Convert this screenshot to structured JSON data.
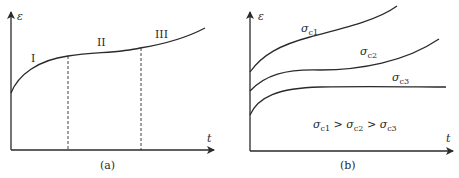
{
  "panel_a": {
    "caption": "(a)",
    "y_axis_label": "ε",
    "x_axis_label": "t",
    "stages": [
      {
        "label": "I"
      },
      {
        "label": "II"
      },
      {
        "label": "III"
      }
    ]
  },
  "panel_b": {
    "caption": "(b)",
    "y_axis_label": "ε",
    "x_axis_label": "t",
    "curves": [
      {
        "symbol": "σ",
        "subscript": "c1"
      },
      {
        "symbol": "σ",
        "subscript": "c2"
      },
      {
        "symbol": "σ",
        "subscript": "c3"
      }
    ],
    "relation": {
      "parts": [
        "σ",
        "c1",
        " > ",
        "σ",
        "c2",
        " > ",
        "σ",
        "c3"
      ]
    }
  },
  "colors": {
    "line": "#2a2a2a",
    "background": "#ffffff"
  }
}
